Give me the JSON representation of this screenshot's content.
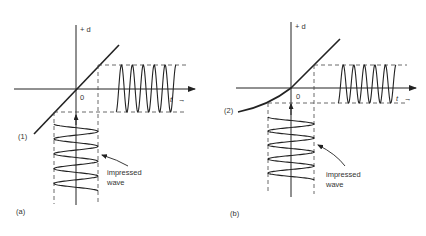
{
  "figure": {
    "colors": {
      "ink": "#222222",
      "text": "#333333",
      "background": "#ffffff"
    },
    "panels": [
      {
        "id": "a",
        "panel_label": "(a)",
        "curve_label": "(1)",
        "curve_type": "linear",
        "y_axis_label": "+ d",
        "origin_label": "0",
        "x_axis_label": "t",
        "x_axis_arrow": "→",
        "impressed_label_line1": "impressed",
        "impressed_label_line2": "wave",
        "output_wave_cycles": 5.5,
        "impressed_wave_cycles": 4.5,
        "output_symmetric": true
      },
      {
        "id": "b",
        "panel_label": "(b)",
        "curve_label": "(2)",
        "curve_type": "nonlinear",
        "y_axis_label": "+ d",
        "origin_label": "0",
        "x_axis_label": "t",
        "x_axis_arrow": "→",
        "impressed_label_line1": "impressed",
        "impressed_label_line2": "wave",
        "output_wave_cycles": 5.5,
        "impressed_wave_cycles": 4.5,
        "output_symmetric": false
      }
    ]
  }
}
